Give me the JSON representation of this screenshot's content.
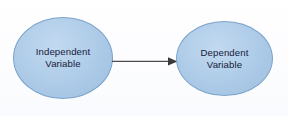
{
  "diagram": {
    "background_color": "#ffffff",
    "node_fill_color": "#aecbe8",
    "node_border_color": "#7ba3cb",
    "text_color": "#14203a",
    "arrow_color": "#4e4e52",
    "nodes": [
      {
        "id": "independent",
        "shape": "ellipse",
        "line1": "Independent",
        "line2": "Variable"
      },
      {
        "id": "dependent",
        "shape": "ellipse",
        "line1": "Dependent",
        "line2": "Variable"
      }
    ],
    "connector": {
      "id": "influence-arrow",
      "type": "arrow",
      "label": "",
      "from": "independent",
      "to": "dependent",
      "direction": "right"
    }
  }
}
